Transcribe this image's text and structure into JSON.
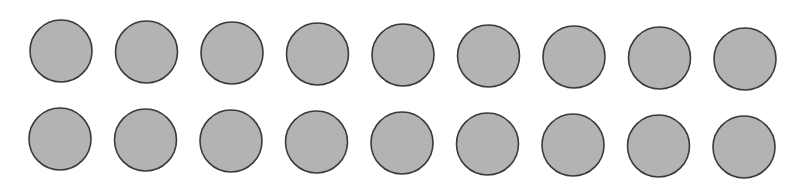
{
  "figure": {
    "rows": 2,
    "per_row": 9,
    "total": 18,
    "fill": "#b3b3b3",
    "stroke": "#3a3a3a",
    "radius": 31,
    "row_start": [
      {
        "x": 61,
        "y": 51
      },
      {
        "x": 60,
        "y": 139
      }
    ],
    "row_end": [
      {
        "x": 745,
        "y": 59
      },
      {
        "x": 744,
        "y": 147
      }
    ]
  }
}
